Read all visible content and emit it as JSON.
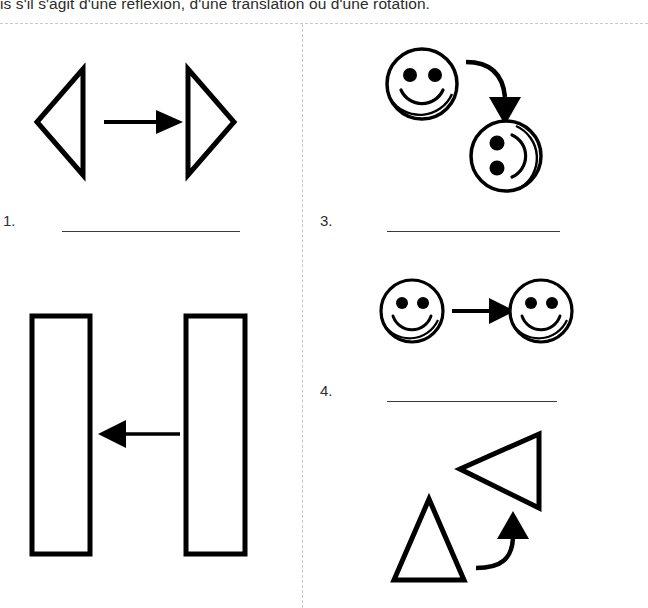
{
  "page": {
    "width": 648,
    "height": 608,
    "background": "#ffffff",
    "ink_color": "#000000",
    "guide_color": "#c9c9c9"
  },
  "instruction": {
    "text": "is s'il s'agit d'une réflexion, d'une translation ou d'une rotation."
  },
  "items": [
    {
      "number": "1.",
      "answer_value": "",
      "figure": "two-triangles-reflection",
      "column": "left",
      "description": "Triangle pointing left and triangle pointing right with straight arrow between them"
    },
    {
      "number": "3.",
      "answer_value": "",
      "figure": "two-smileys-rotation",
      "column": "right",
      "description": "Upright smiley face with curved arrow to a smiley face rotated ninety degrees"
    },
    {
      "number": "4.",
      "answer_value": "",
      "figure": "two-smileys-translation",
      "column": "right",
      "description": "Two identical smiley faces side by side joined by a straight arrow"
    }
  ],
  "figures": {
    "triangles_reflection": {
      "left_shape": "triangle-pointing-left",
      "right_shape": "triangle-pointing-right",
      "arrow": "straight-arrow-right"
    },
    "rectangles_translation": {
      "left_shape": "tall-rectangle",
      "right_shape": "tall-rectangle",
      "arrow": "straight-arrow-left"
    },
    "smileys_rotation": {
      "source_shape": "smiley-face-upright",
      "target_shape": "smiley-face-rotated",
      "arrow": "curved-arrow-down"
    },
    "smileys_translation": {
      "source_shape": "smiley-face-upright",
      "target_shape": "smiley-face-upright",
      "arrow": "straight-arrow-right"
    },
    "triangles_rotation": {
      "source_shape": "triangle-pointing-up",
      "target_shape": "triangle-pointing-left",
      "arrow": "curved-arrow-up"
    }
  },
  "ghost_text": {
    "line1": "",
    "line2": "",
    "line3": "",
    "line4": ""
  }
}
